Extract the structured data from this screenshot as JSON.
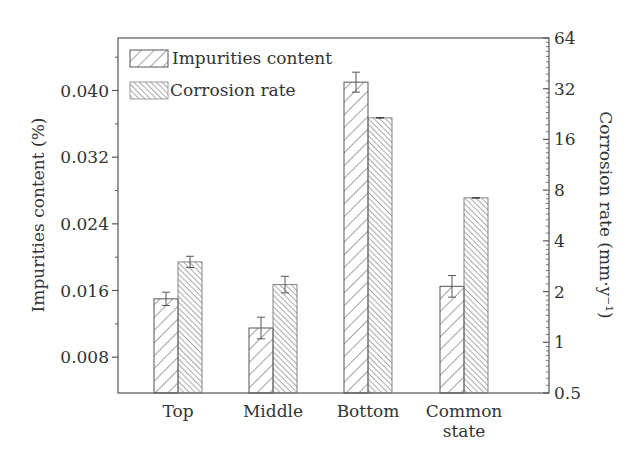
{
  "chart_data": {
    "type": "bar",
    "title": "",
    "categories": [
      "Top",
      "Middle",
      "Bottom",
      "Common state"
    ],
    "category_labels": [
      [
        "Top"
      ],
      [
        "Middle"
      ],
      [
        "Bottom"
      ],
      [
        "Common",
        "state"
      ]
    ],
    "series": [
      {
        "name": "Impurities content",
        "axis": "left",
        "pattern": "sparse-forward-hatch",
        "values": [
          0.015,
          0.0115,
          0.041,
          0.0165
        ],
        "error": [
          0.0008,
          0.0013,
          0.0012,
          0.0013
        ]
      },
      {
        "name": "Corrosion rate",
        "axis": "right",
        "pattern": "dense-back-hatch",
        "values": [
          3.0,
          2.2,
          21.5,
          7.2
        ],
        "error_factor": [
          1.08,
          1.12,
          1.0,
          1.0
        ]
      }
    ],
    "ylabel": "Impurities content (%)",
    "ylabel_right": "Corrosion rate (mm·y⁻¹)",
    "xlabel": "",
    "y_left": {
      "ticks": [
        0.008,
        0.016,
        0.024,
        0.032,
        0.04
      ],
      "tick_labels": [
        "0.008",
        "0.016",
        "0.024",
        "0.032",
        "0.040"
      ],
      "minor_ticks": [
        0.012,
        0.02,
        0.028,
        0.036,
        0.044
      ],
      "ylim": [
        0.0037,
        0.0463
      ]
    },
    "y_right": {
      "scale": "log2",
      "ticks": [
        0.5,
        1,
        2,
        4,
        8,
        16,
        32,
        64
      ],
      "tick_labels": [
        "0.5",
        "1",
        "2",
        "4",
        "8",
        "16",
        "32",
        "64"
      ],
      "ylim": [
        0.5,
        64
      ]
    },
    "legend": {
      "position": "upper-left",
      "entries": [
        "Impurities content",
        "Corrosion rate"
      ]
    },
    "grid": false
  }
}
